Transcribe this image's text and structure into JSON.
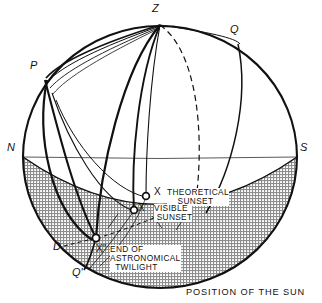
{
  "figure": {
    "caption": "POSITION OF THE SUN",
    "type": "celestial-sphere-diagram"
  },
  "sphere": {
    "cx": 160,
    "cy": 157,
    "rx": 137,
    "ry": 131,
    "outline_color": "#111111",
    "shaded_region_color": "#9a9a9a",
    "shaded_region_name": "below-horizon"
  },
  "cardinal_points": [
    {
      "id": "Z",
      "label": "Z",
      "x": 158,
      "y": 12,
      "desc": "zenith"
    },
    {
      "id": "Q",
      "label": "Q",
      "x": 234,
      "y": 32,
      "desc": "equator-east"
    },
    {
      "id": "P",
      "label": "P",
      "x": 34,
      "y": 68,
      "desc": "celestial-pole"
    },
    {
      "id": "N",
      "label": "N",
      "x": 11,
      "y": 150,
      "desc": "north-point"
    },
    {
      "id": "S",
      "label": "S",
      "x": 303,
      "y": 150,
      "desc": "south-point"
    },
    {
      "id": "D",
      "label": "D",
      "x": 57,
      "y": 249,
      "desc": "depression-point"
    },
    {
      "id": "Qp",
      "label": "Q'",
      "x": 77,
      "y": 275,
      "desc": "equator-lower"
    }
  ],
  "sun_positions": [
    {
      "id": "theoretical-sunset",
      "marker_x": 146,
      "marker_y": 196,
      "x_label": "X",
      "x_label_x": 156,
      "x_label_y": 189,
      "text": "THEORETICAL\n    SUNSET",
      "text_x": 167,
      "text_y": 188
    },
    {
      "id": "visible-sunset",
      "marker_x": 134,
      "marker_y": 210,
      "x_label": "X'",
      "x_label_x": 140,
      "x_label_y": 205,
      "text": "VISIBLE\n SUNSET",
      "text_x": 154,
      "text_y": 204
    },
    {
      "id": "end-of-astronomical-twilight",
      "marker_x": 96,
      "marker_y": 238,
      "x_label": "X″",
      "x_label_x": 99,
      "x_label_y": 246,
      "text": "END OF\nASTRONOMICAL\n  TWILIGHT",
      "text_x": 111,
      "text_y": 246
    }
  ],
  "curves": {
    "horizon_name": "horizon-ellipse-arc",
    "meridians_count": 4,
    "dashed_curve_name": "dashed-meridian",
    "dashed_horizon_name": "dashed-depression-line"
  }
}
